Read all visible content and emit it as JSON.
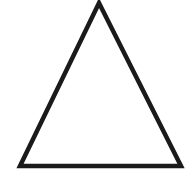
{
  "canvas": {
    "width": 191,
    "height": 173,
    "background_color": "#ffffff",
    "alt_text": "Black outlined triangle"
  },
  "shape": {
    "name": "triangle",
    "type": "polygon",
    "sides": 3,
    "classification": "isosceles",
    "fill": "none",
    "fill_color": "#ffffff",
    "stroke_color": "#1a1a1a",
    "stroke_width": 4.5,
    "stroke_linejoin": "miter",
    "vertices": [
      {
        "label": "apex",
        "x": 99,
        "y": 3
      },
      {
        "label": "bottom-right",
        "x": 181,
        "y": 166
      },
      {
        "label": "bottom-left",
        "x": 20,
        "y": 166
      }
    ],
    "points_attr": "99,3 181,166 20,166"
  }
}
